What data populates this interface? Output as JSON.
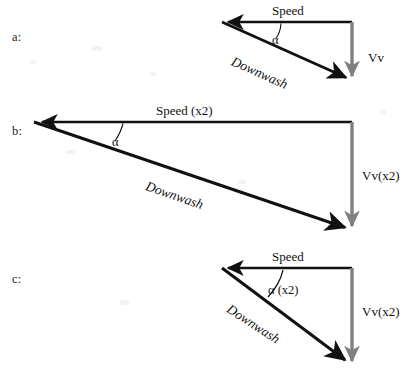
{
  "figure": {
    "type": "vector-diagram",
    "background_color": "#ffffff",
    "stroke_color_primary": "#111111",
    "stroke_color_secondary": "#808080"
  },
  "rows": [
    {
      "id": "a",
      "row_label": "a:",
      "labels": {
        "speed": "Speed",
        "downwash": "Downwash",
        "vertical": "Vv",
        "angle": "α"
      },
      "geometry": {
        "corner_x": 352,
        "corner_y": 22,
        "tip_left_x": 222,
        "tip_left_y": 22,
        "tip_down_x": 352,
        "tip_down_y": 80,
        "speed_length": 130,
        "vertical_length": 58
      }
    },
    {
      "id": "b",
      "row_label": "b:",
      "labels": {
        "speed": "Speed (x2)",
        "downwash": "Downwash",
        "vertical": "Vv(x2)",
        "angle": "α"
      },
      "geometry": {
        "corner_x": 352,
        "corner_y": 122,
        "tip_left_x": 34,
        "tip_left_y": 122,
        "tip_down_x": 352,
        "tip_down_y": 230,
        "speed_length": 318,
        "vertical_length": 108
      }
    },
    {
      "id": "c",
      "row_label": "c:",
      "labels": {
        "speed": "Speed",
        "downwash": "Downwash",
        "vertical": "Vv(x2)",
        "angle": "α (x2)"
      },
      "geometry": {
        "corner_x": 352,
        "corner_y": 268,
        "tip_left_x": 222,
        "tip_left_y": 268,
        "tip_down_x": 352,
        "tip_down_y": 365,
        "speed_length": 130,
        "vertical_length": 97
      }
    }
  ],
  "legend_notes": {
    "speed_vector_direction": "leftward horizontal",
    "vertical_vector_direction": "downward",
    "downwash_vector_direction": "diagonal down-right (resultant)"
  }
}
